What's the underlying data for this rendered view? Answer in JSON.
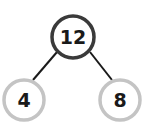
{
  "diagram": {
    "type": "number-bond",
    "root": {
      "value": "12",
      "stroke": "#3a3a3a"
    },
    "children": [
      {
        "value": "4",
        "stroke": "#c4c4c4"
      },
      {
        "value": "8",
        "stroke": "#c4c4c4"
      }
    ],
    "connector_color": "#1a1a1a"
  }
}
